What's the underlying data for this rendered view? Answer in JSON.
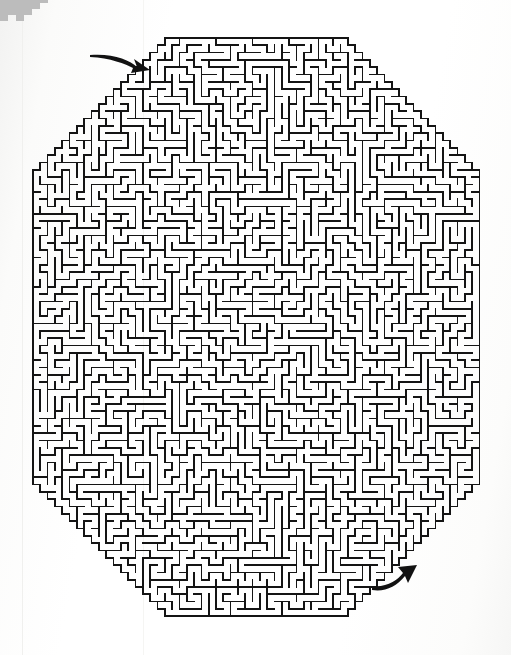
{
  "document": {
    "kind": "printed-maze-puzzle",
    "title": "Octagonal Maze",
    "background_color": "#fdfdfc",
    "ink_color": "#1a1a1a"
  },
  "maze": {
    "shape": "octagon",
    "wall_color": "#141414",
    "wall_thickness_px": 1.7,
    "cell_size_px": 7.32,
    "columns": 61,
    "rows": 79,
    "bounds": {
      "left_px": 33,
      "top_px": 38,
      "right_px": 478,
      "bottom_px": 615
    },
    "corner_cut_cells": 18,
    "seed": 20250417,
    "entrance": {
      "label": "entrance",
      "side": "top-left-diagonal",
      "col": 16,
      "row": 4
    },
    "exit": {
      "label": "exit",
      "side": "bottom-right-diagonal",
      "col": 47,
      "row": 74
    }
  },
  "annotations": {
    "entrance_arrow": {
      "name": "entrance-arrow",
      "direction": "points-right-down-into-maze",
      "tail_px": [
        90,
        55
      ],
      "tip_px": [
        150,
        70
      ],
      "color": "#121212"
    },
    "exit_arrow": {
      "name": "exit-arrow",
      "direction": "points-up-right-out-of-maze",
      "tail_px": [
        372,
        586
      ],
      "tip_px": [
        417,
        565
      ],
      "color": "#121212"
    }
  },
  "artifacts": {
    "corner_blob": {
      "name": "scan-artifact-blob",
      "position": "top-left",
      "color": "#b9b9b9"
    },
    "scan_rules": [
      {
        "name": "scan-rule-left",
        "x_px": 22,
        "color": "#f0f0ee"
      },
      {
        "name": "scan-rule-mid",
        "x_px": 143,
        "color": "#f4f4f2"
      }
    ]
  }
}
